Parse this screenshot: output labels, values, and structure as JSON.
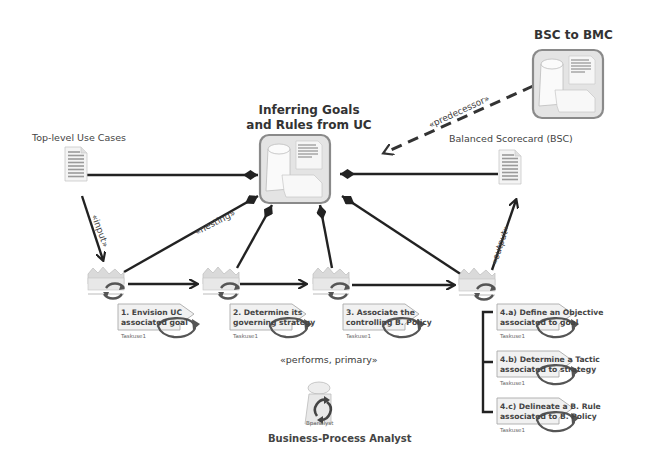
{
  "diagram": {
    "packages": {
      "main": {
        "title_line1": "Inferring Goals",
        "title_line2": "and Rules from UC"
      },
      "bsc_to_bmc": {
        "title": "BSC to BMC"
      }
    },
    "artifacts": {
      "use_cases": {
        "label": "Top-level Use Cases"
      },
      "bsc": {
        "label": "Balanced Scorecard (BSC)"
      }
    },
    "stereotypes": {
      "input": "«input»",
      "nesting": "«nesting»",
      "output": "«output»",
      "predecessor": "«predecessor»",
      "performs": "«performs, primary»"
    },
    "tasks": [
      {
        "line1": "1. Envision UC",
        "line2": "associated goal",
        "tag": "Taskuse1"
      },
      {
        "line1": "2. Determine its",
        "line2": "governing strategy",
        "tag": "Taskuse1"
      },
      {
        "line1": "3. Associate the",
        "line2": "controlling B. Policy",
        "tag": "Taskuse1"
      }
    ],
    "subtasks": [
      {
        "line1": "4.a) Define an Objective",
        "line2": "associated to goal",
        "tag": "Taskuse1"
      },
      {
        "line1": "4.b) Determine a Tactic",
        "line2": "associated to strategy",
        "tag": "Taskuse1"
      },
      {
        "line1": "4.c) Delineate a B. Rule",
        "line2": "associated to B. Policy",
        "tag": "Taskuse1"
      }
    ],
    "role": {
      "label": "Business-Process  Analyst",
      "icon_tag": "Bpanalyst"
    },
    "colors": {
      "line": "#222222",
      "package_border": "#8a8a8a",
      "package_fill": "#e6e6e6",
      "doc_fill": "#f2f2f2",
      "doc_lines": "#9a9a9a",
      "task_fill": "#f0f0f0",
      "cycle_arrow": "#555555"
    }
  }
}
